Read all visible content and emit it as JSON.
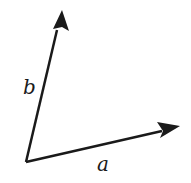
{
  "diagram": {
    "type": "vectors",
    "origin": [
      26,
      162
    ],
    "vectors": [
      {
        "name": "a",
        "label": "a",
        "tip": [
          180,
          126
        ],
        "label_pos": [
          97,
          171
        ]
      },
      {
        "name": "b",
        "label": "b",
        "tip": [
          62,
          10
        ],
        "label_pos": [
          23,
          94
        ]
      }
    ],
    "colors": {
      "stroke": "#1a1a1a",
      "background": "#ffffff"
    }
  }
}
